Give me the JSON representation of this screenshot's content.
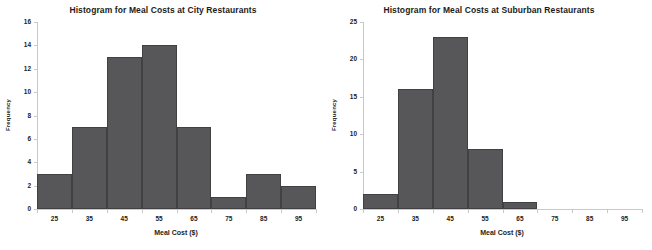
{
  "figure": {
    "background_color": "#ffffff",
    "width": 652,
    "height": 250
  },
  "charts": [
    {
      "id": "city-histogram",
      "title": "Histogram for Meal Costs at City Restaurants",
      "xlabel": "Meal Cost ($)",
      "ylabel": "Frequency",
      "bar_color": "#575759",
      "bar_border_color": "#414143",
      "axis_color": "#c9c9c9"
    },
    {
      "id": "suburban-histogram",
      "title": "Histogram for Meal Costs at Suburban Restaurants",
      "xlabel": "Meal Cost ($)",
      "ylabel": "Frequency",
      "bar_color": "#575759",
      "bar_border_color": "#414143",
      "axis_color": "#c9c9c9"
    }
  ],
  "chart_data": [
    {
      "type": "bar",
      "title": "Histogram for Meal Costs at City Restaurants",
      "xlabel": "Meal Cost ($)",
      "ylabel": "Frequency",
      "categories": [
        "25",
        "35",
        "45",
        "55",
        "65",
        "75",
        "85",
        "95"
      ],
      "values": [
        3,
        7,
        13,
        14,
        7,
        1,
        3,
        2
      ],
      "ylim": [
        0,
        16
      ],
      "yticks": [
        0,
        2,
        4,
        6,
        8,
        10,
        12,
        14,
        16
      ],
      "xticklabels": [
        "25",
        "35",
        "45",
        "55",
        "65",
        "75",
        "85",
        "95"
      ],
      "grid": false,
      "legend": "none"
    },
    {
      "type": "bar",
      "title": "Histogram for Meal Costs at Suburban Restaurants",
      "xlabel": "Meal Cost ($)",
      "ylabel": "Frequency",
      "categories": [
        "25",
        "35",
        "45",
        "55",
        "65",
        "75",
        "85",
        "95"
      ],
      "values": [
        2,
        16,
        23,
        8,
        1,
        0,
        0,
        0
      ],
      "ylim": [
        0,
        25
      ],
      "yticks": [
        0,
        5,
        10,
        15,
        20,
        25
      ],
      "xticklabels": [
        "25",
        "35",
        "45",
        "55",
        "65",
        "75",
        "85",
        "95"
      ],
      "grid": false,
      "legend": "none"
    }
  ]
}
